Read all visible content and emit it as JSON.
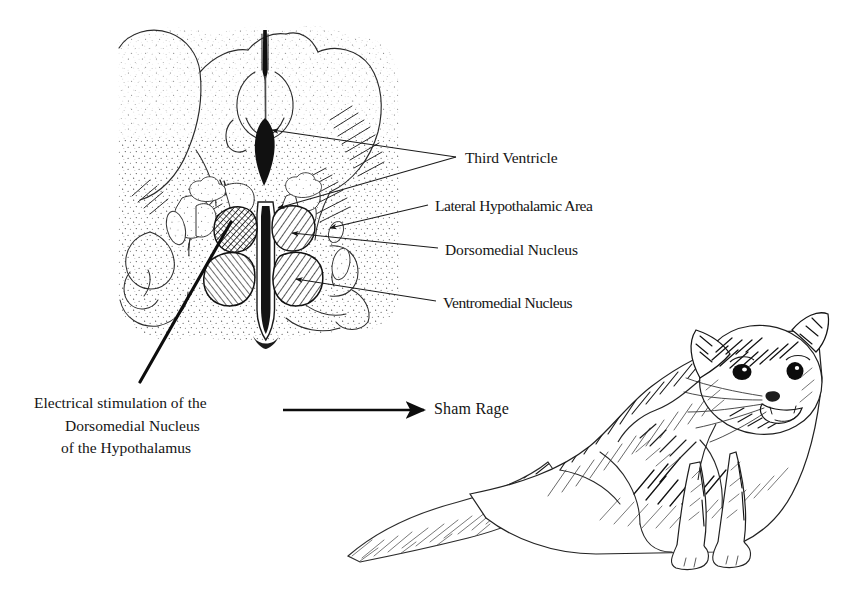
{
  "figure": {
    "type": "anatomical-diagram",
    "background_color": "#ffffff",
    "ink_color": "#141414"
  },
  "diagram": {
    "name": "coronal-brain-section"
  },
  "labels": [
    {
      "id": "third-ventricle",
      "text": "Third Ventricle",
      "x": 465,
      "y": 149
    },
    {
      "id": "lateral-hypothalamic-area",
      "text": "Lateral Hypothalamic Area",
      "x": 435,
      "y": 197
    },
    {
      "id": "dorsomedial-nucleus",
      "text": "Dorsomedial Nucleus",
      "x": 445,
      "y": 241
    },
    {
      "id": "ventromedial-nucleus",
      "text": "Ventromedial Nucleus",
      "x": 443,
      "y": 294
    }
  ],
  "caption": {
    "line1": "Electrical stimulation of the",
    "line2": "Dorsomedial Nucleus",
    "line3": "of the Hypothalamus"
  },
  "outcome": {
    "arrow": "right-arrow",
    "label": "Sham Rage"
  },
  "cat": {
    "name": "sham-rage-cat",
    "description": "Pen-and-ink drawing of a cat crouched in a defensive-aggressive posture with arched back, piloerect fur, flattened ears, dilated pupils and open mouth"
  }
}
